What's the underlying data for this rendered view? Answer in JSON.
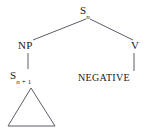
{
  "diagram": {
    "type": "syntax-tree",
    "title": "",
    "background_color": "#ffffff",
    "line_color": "#4a4a5a",
    "text_color": "#1a1a1a",
    "nodes": {
      "root": {
        "label": "S",
        "subscript": "n",
        "full_text": "S_n"
      },
      "np": {
        "label": "NP"
      },
      "embedded_s": {
        "label": "S",
        "subscript_base": "n",
        "subscript_op": " + ",
        "subscript_num": "1",
        "full_text": "S_n+1"
      },
      "v": {
        "label": "V"
      },
      "negative": {
        "label": "NEGATIVE"
      }
    },
    "triangle": {
      "name": "elided-subtree-triangle",
      "description": "open triangle under embedded S node"
    },
    "edges": [
      {
        "from": "root",
        "to": "np"
      },
      {
        "from": "root",
        "to": "v"
      },
      {
        "from": "np",
        "to": "embedded_s"
      },
      {
        "from": "v",
        "to": "negative"
      },
      {
        "from": "embedded_s",
        "to": "triangle"
      }
    ]
  }
}
